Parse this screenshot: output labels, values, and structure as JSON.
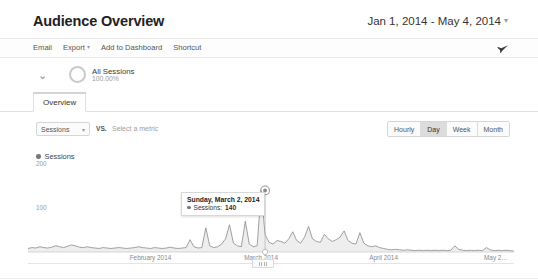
{
  "header": {
    "title": "Audience Overview",
    "date_range": "Jan 1, 2014 - May 4, 2014",
    "date_range_caret": "▾"
  },
  "toolbar": {
    "email_label": "Email",
    "export_label": "Export",
    "export_caret": "▾",
    "add_to_dashboard_label": "Add to Dashboard",
    "shortcut_label": "Shortcut",
    "share_icon": "share-icon"
  },
  "segment": {
    "expander_icon": "chevron-down-icon",
    "expander_glyph": "⌄",
    "donut_icon": "donut-chart-icon",
    "name": "All Sessions",
    "percent": "100.00%"
  },
  "tabs": [
    {
      "label": "Overview",
      "selected": true
    }
  ],
  "metric_row": {
    "primary_metric": "Sessions",
    "primary_caret": "▾",
    "vs_label": "VS.",
    "secondary_placeholder": "Select a metric",
    "granularity": [
      {
        "label": "Hourly",
        "selected": false
      },
      {
        "label": "Day",
        "selected": true
      },
      {
        "label": "Week",
        "selected": false
      },
      {
        "label": "Month",
        "selected": false
      }
    ]
  },
  "legend": {
    "series_name": "Sessions",
    "series_color": "#777777"
  },
  "tooltip": {
    "date": "Sunday, March 2, 2014",
    "metric_label": "Sessions:",
    "metric_value": "140",
    "dot_color": "#777777"
  },
  "slider": {
    "grip_icon": "drag-handle-icon"
  },
  "colors": {
    "line": "#8a8a8a",
    "fill": "#f0f0f0",
    "axis": "#cccccc",
    "selected_button_bg": "#dcdcdc",
    "text": "#444444"
  },
  "chart_data": {
    "type": "area",
    "title": "",
    "xlabel": "",
    "ylabel": "Sessions",
    "ylim": [
      0,
      200
    ],
    "yticks": [
      100,
      200
    ],
    "grid": false,
    "legend_position": "top-left",
    "xtick_labels": [
      "February 2014",
      "March 2014",
      "April 2014",
      "May 2..."
    ],
    "xtick_positions": [
      31,
      59,
      90,
      120
    ],
    "x_unit": "day index from Jan 1, 2014",
    "annotations": [
      {
        "x": 60,
        "y": 140,
        "date": "Sunday, March 2, 2014",
        "label": "Sessions: 140",
        "marker": "ringed-circle"
      }
    ],
    "series": [
      {
        "name": "Sessions",
        "color": "#8a8a8a",
        "values": [
          8,
          10,
          9,
          12,
          10,
          9,
          11,
          14,
          12,
          10,
          13,
          16,
          14,
          11,
          10,
          12,
          10,
          9,
          8,
          10,
          9,
          8,
          9,
          10,
          9,
          8,
          9,
          10,
          12,
          10,
          9,
          8,
          10,
          9,
          8,
          9,
          11,
          9,
          8,
          9,
          10,
          28,
          12,
          9,
          10,
          55,
          14,
          10,
          12,
          18,
          30,
          62,
          20,
          14,
          12,
          70,
          18,
          12,
          14,
          140,
          40,
          22,
          18,
          26,
          24,
          20,
          30,
          46,
          26,
          20,
          34,
          58,
          30,
          24,
          22,
          40,
          30,
          24,
          28,
          34,
          48,
          26,
          20,
          18,
          44,
          20,
          14,
          12,
          14,
          10,
          8,
          6,
          5,
          6,
          5,
          4,
          5,
          4,
          3,
          4,
          3,
          4,
          3,
          4,
          3,
          4,
          3,
          4,
          14,
          6,
          4,
          3,
          4,
          3,
          4,
          3,
          10,
          5,
          3,
          4,
          3,
          4,
          3,
          2
        ]
      }
    ]
  }
}
